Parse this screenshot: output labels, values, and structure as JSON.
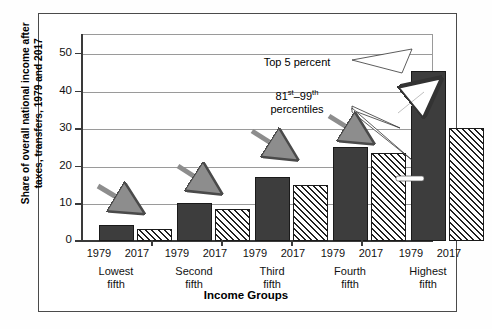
{
  "chart_data": {
    "type": "bar",
    "title": "",
    "subtitle": "",
    "xlabel": "Income Groups",
    "ylabel": "Share of overall national income after taxes, transfers, 1979 and 2017",
    "ylim": [
      0,
      55
    ],
    "yticks": [
      0,
      10,
      20,
      30,
      40,
      50
    ],
    "ytick_labels": [
      "0",
      "10",
      "20",
      "30",
      "40",
      "50"
    ],
    "grid": true,
    "legend": "none",
    "categories": [
      "Lowest fifth",
      "Second fifth",
      "Third fifth",
      "Fourth fifth",
      "Highest fifth"
    ],
    "category_lines": [
      [
        "Lowest",
        "fifth"
      ],
      [
        "Second",
        "fifth"
      ],
      [
        "Third",
        "fifth"
      ],
      [
        "Fourth",
        "fifth"
      ],
      [
        "Highest",
        "fifth"
      ]
    ],
    "series": [
      {
        "name": "1979",
        "values": [
          4.2,
          10.0,
          17.0,
          25.0,
          45.2
        ]
      },
      {
        "name": "2017",
        "values": [
          3.2,
          8.5,
          14.8,
          23.3,
          52.0
        ]
      }
    ],
    "bar_labels": [
      "1979",
      "2017"
    ],
    "highest_fifth_breakdown": {
      "1979": {
        "top_5_percent": 16.2,
        "percentiles_81_99": 29.0,
        "total": 45.2
      },
      "2017": {
        "top_5_percent": 22.0,
        "percentiles_81_99": 30.0,
        "total": 52.0
      }
    },
    "annotations": [
      {
        "text": "Top 5 percent",
        "target": "upper stacked segment of Highest fifth bars"
      },
      {
        "text": "81st–99th percentiles",
        "target": "lower stacked segment of Highest fifth bars"
      }
    ],
    "annotation_top5": "Top 5 percent",
    "annotation_percentiles_line1_pre": "81",
    "annotation_percentiles_line1_sup1": "st",
    "annotation_percentiles_line1_mid": "–99",
    "annotation_percentiles_line1_sup2": "th",
    "annotation_percentiles_line2": "percentiles",
    "trend_arrows": [
      {
        "group": "Lowest fifth",
        "direction": "down",
        "style": "gray"
      },
      {
        "group": "Second fifth",
        "direction": "down",
        "style": "gray"
      },
      {
        "group": "Third fifth",
        "direction": "down",
        "style": "gray"
      },
      {
        "group": "Fourth fifth",
        "direction": "down",
        "style": "gray"
      },
      {
        "group": "Highest fifth",
        "direction": "up",
        "style": "white"
      }
    ]
  }
}
